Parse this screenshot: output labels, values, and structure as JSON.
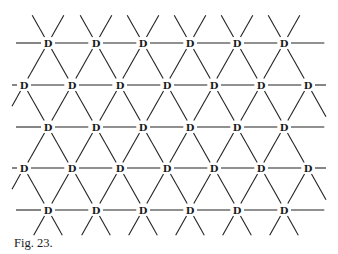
{
  "figure": {
    "caption": "Fig. 23.",
    "node_label": "D",
    "line_color": "#222222",
    "background": "#ffffff",
    "lattice": {
      "type": "triangular",
      "rows": [
        {
          "y": 43,
          "xs": [
            48,
            96,
            143,
            190,
            237,
            284
          ]
        },
        {
          "y": 85,
          "xs": [
            24,
            72,
            120,
            167,
            214,
            261,
            308
          ]
        },
        {
          "y": 127,
          "xs": [
            48,
            96,
            143,
            190,
            237,
            284
          ]
        },
        {
          "y": 168,
          "xs": [
            24,
            72,
            120,
            167,
            214,
            261,
            308
          ]
        },
        {
          "y": 210,
          "xs": [
            48,
            96,
            143,
            190,
            237,
            284
          ]
        }
      ],
      "dx": 47.3,
      "dy": 41.7
    }
  }
}
